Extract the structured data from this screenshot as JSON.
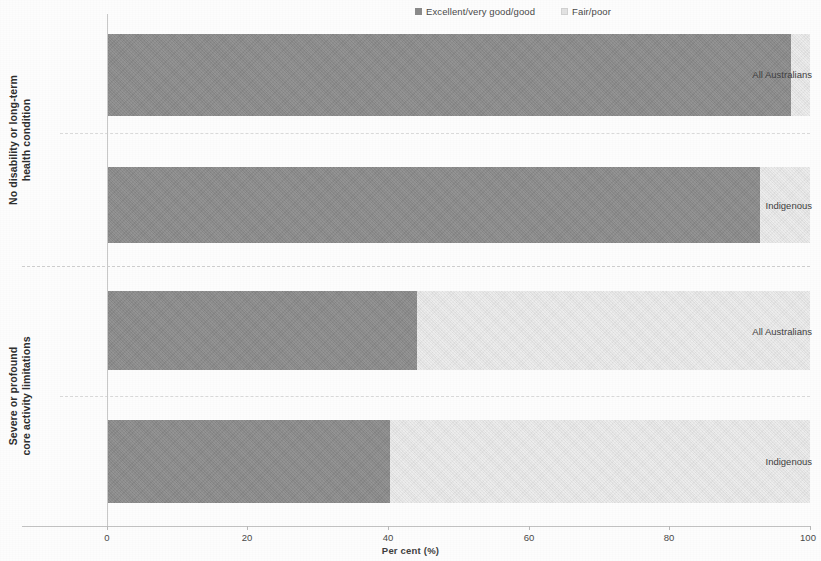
{
  "chart_data": {
    "type": "bar",
    "orientation": "horizontal",
    "stacked": true,
    "stacked_mode": "percent",
    "title": "",
    "subtitle": "",
    "xlabel": "Per cent (%)",
    "ylabel": "",
    "xlim": [
      0,
      100
    ],
    "xticks": [
      0,
      20,
      40,
      60,
      80,
      100
    ],
    "xtick_labels": [
      "0",
      "20",
      "40",
      "60",
      "80",
      "100"
    ],
    "grid": false,
    "legend_position": "top-center",
    "legend": [
      {
        "label": "Excellent/very good/good",
        "color": "#8c8c8c",
        "swatch": "dark"
      },
      {
        "label": "Fair/poor",
        "color": "#e6e6e6",
        "swatch": "light"
      }
    ],
    "series": [
      {
        "name": "Excellent/very good/good",
        "color": "#8c8c8c",
        "values": [
          97.3,
          92.9,
          44.1,
          40.3
        ]
      },
      {
        "name": "Fair/poor",
        "color": "#e6e6e6",
        "values": [
          2.7,
          7.1,
          55.9,
          59.7
        ]
      }
    ],
    "categories": [
      "All Australians",
      "Indigenous",
      "All Australians",
      "Indigenous"
    ],
    "groups": [
      {
        "label": "No disability or long-term health condition",
        "categories": [
          "All Australians",
          "Indigenous"
        ]
      },
      {
        "label": "Severe or profound core activity limitations",
        "categories": [
          "All Australians",
          "Indigenous"
        ]
      }
    ]
  },
  "legend": {
    "items": [
      {
        "label": "Excellent/very good/good"
      },
      {
        "label": "Fair/poor"
      }
    ]
  },
  "axis": {
    "x_title": "Per cent (%)",
    "ticks": [
      {
        "label": "0"
      },
      {
        "label": "20"
      },
      {
        "label": "40"
      },
      {
        "label": "60"
      },
      {
        "label": "80"
      },
      {
        "label": "100"
      }
    ]
  },
  "groups": [
    {
      "label": "No disability or long-term health condition"
    },
    {
      "label": "Severe or profound core activity limitations"
    }
  ],
  "bars": [
    {
      "category": "All Australians",
      "good": 97.3,
      "fair": 2.7
    },
    {
      "category": "Indigenous",
      "good": 92.9,
      "fair": 7.1
    },
    {
      "category": "All Australians",
      "good": 44.1,
      "fair": 55.9
    },
    {
      "category": "Indigenous",
      "good": 40.3,
      "fair": 59.7
    }
  ]
}
